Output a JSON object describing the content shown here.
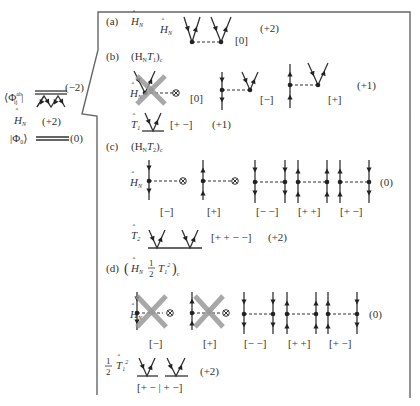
{
  "left_panel": {
    "bra_label": "⟨Φ",
    "bra_sup": "ab",
    "bra_sub": "ij",
    "bra_close": "|",
    "bra_level": "(−2)",
    "hn_label": "H",
    "hn_sub": "N",
    "hn_level": "(+2)",
    "ket_label": "|Φ",
    "ket_sub": "0",
    "ket_close": "⟩",
    "ket_level": "(0)"
  },
  "sections": {
    "a": {
      "tag": "(a)",
      "title": "H",
      "title_sub": "N",
      "row_label": "H",
      "row_label_sub": "N",
      "bracket": "[0]",
      "excitation": "(+2)"
    },
    "b": {
      "tag": "(b)",
      "title": "(H",
      "title_sub": "N",
      "title_mid": "T",
      "title_mid_sub": "1",
      "title_end": ")",
      "title_end_sub": "c",
      "hn_label": "H",
      "hn_sub": "N",
      "brackets": [
        "[0]",
        "[−]",
        "[+]"
      ],
      "excitation": "(+1)",
      "t_label": "T",
      "t_sub": "1",
      "t_bracket": "[+ −]",
      "t_excitation": "(+1)"
    },
    "c": {
      "tag": "(c)",
      "title": "(H",
      "title_sub": "N",
      "title_mid": "T",
      "title_mid_sub": "2",
      "title_end": ")",
      "title_end_sub": "c",
      "hn_label": "H",
      "hn_sub": "N",
      "brackets": [
        "[−]",
        "[+]",
        "[− −]",
        "[+ +]",
        "[+ −]"
      ],
      "excitation": "(0)",
      "t_label": "T",
      "t_sub": "2",
      "t_bracket": "[+ + − −]",
      "t_excitation": "(+2)"
    },
    "d": {
      "tag": "(d)",
      "title_open": "(",
      "title": "H",
      "title_sub": "N",
      "frac_num": "1",
      "frac_den": "2",
      "title_mid": "T",
      "title_mid_sub": "1",
      "title_mid_sup": "2",
      "title_end": ")",
      "title_end_sub": "c",
      "hn_label": "H",
      "hn_sub": "N",
      "brackets": [
        "[−]",
        "[+]",
        "[− −]",
        "[+ +]",
        "[+ −]"
      ],
      "excitation": "(0)",
      "t_frac_num": "1",
      "t_frac_den": "2",
      "t_label": "T",
      "t_sub": "1",
      "t_sup": "2",
      "t_bracket": "[+ − | + −]",
      "t_excitation": "(+2)"
    }
  },
  "colors": {
    "line": "#333333",
    "frame": "#666666",
    "cross_out": "#999999"
  }
}
